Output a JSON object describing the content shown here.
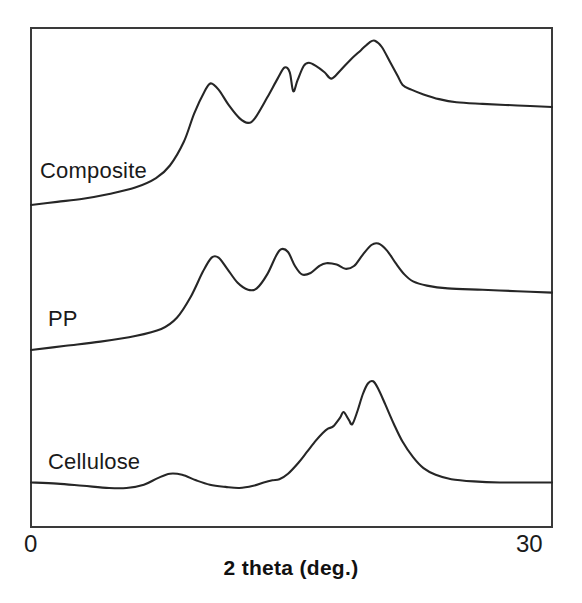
{
  "chart_data": {
    "type": "line",
    "title": "",
    "xlabel": "2 theta (deg.)",
    "ylabel": "",
    "xlim": [
      0,
      30
    ],
    "xticks": [
      0,
      30
    ],
    "xtick_labels": [
      "0",
      "30"
    ],
    "yticks": [],
    "grid": false,
    "legend": "inline-curve-labels",
    "note": "Stacked XRD diffractograms; intensity in arbitrary units, curves offset vertically.",
    "series": [
      {
        "name": "Composite",
        "label": "Composite",
        "color": "#262626",
        "peaks_2theta": [
          10.3,
          14.6,
          16.0,
          19.7,
          21.0
        ],
        "peak_notes": "first peak ~10.3 deg, doublet near 14-16 deg, strongest peak ~19.7 deg with shoulder ~21 deg",
        "points": [
          [
            0.0,
            0.0
          ],
          [
            1.5,
            0.02
          ],
          [
            3.0,
            0.04
          ],
          [
            4.5,
            0.07
          ],
          [
            6.0,
            0.11
          ],
          [
            7.2,
            0.17
          ],
          [
            8.0,
            0.25
          ],
          [
            8.8,
            0.4
          ],
          [
            9.4,
            0.58
          ],
          [
            10.0,
            0.72
          ],
          [
            10.35,
            0.77
          ],
          [
            10.8,
            0.73
          ],
          [
            11.4,
            0.63
          ],
          [
            12.0,
            0.55
          ],
          [
            12.5,
            0.52
          ],
          [
            12.9,
            0.55
          ],
          [
            13.6,
            0.68
          ],
          [
            14.2,
            0.8
          ],
          [
            14.6,
            0.87
          ],
          [
            14.9,
            0.84
          ],
          [
            15.1,
            0.72
          ],
          [
            15.35,
            0.79
          ],
          [
            15.7,
            0.88
          ],
          [
            16.0,
            0.9
          ],
          [
            16.4,
            0.88
          ],
          [
            16.9,
            0.84
          ],
          [
            17.3,
            0.8
          ],
          [
            17.8,
            0.85
          ],
          [
            18.4,
            0.92
          ],
          [
            19.0,
            0.98
          ],
          [
            19.5,
            1.03
          ],
          [
            19.8,
            1.04
          ],
          [
            20.2,
            1.0
          ],
          [
            20.7,
            0.9
          ],
          [
            21.1,
            0.82
          ],
          [
            21.4,
            0.76
          ],
          [
            21.9,
            0.73
          ],
          [
            22.6,
            0.7
          ],
          [
            23.5,
            0.67
          ],
          [
            24.5,
            0.65
          ],
          [
            26.0,
            0.64
          ],
          [
            28.0,
            0.63
          ],
          [
            30.0,
            0.62
          ]
        ]
      },
      {
        "name": "PP",
        "label": "PP",
        "color": "#262626",
        "peaks_2theta": [
          10.5,
          14.3,
          17.0,
          19.5
        ],
        "peak_notes": "polypropylene reflections: ~10.5, ~14.3, ~17.0 deg and main ~19.5 deg",
        "points": [
          [
            0.0,
            0.0
          ],
          [
            2.0,
            0.03
          ],
          [
            4.0,
            0.06
          ],
          [
            6.0,
            0.1
          ],
          [
            7.5,
            0.15
          ],
          [
            8.4,
            0.23
          ],
          [
            9.2,
            0.38
          ],
          [
            9.9,
            0.56
          ],
          [
            10.4,
            0.66
          ],
          [
            10.8,
            0.66
          ],
          [
            11.3,
            0.58
          ],
          [
            11.9,
            0.48
          ],
          [
            12.5,
            0.43
          ],
          [
            13.0,
            0.44
          ],
          [
            13.6,
            0.54
          ],
          [
            14.1,
            0.67
          ],
          [
            14.4,
            0.72
          ],
          [
            14.8,
            0.7
          ],
          [
            15.2,
            0.6
          ],
          [
            15.6,
            0.54
          ],
          [
            16.1,
            0.55
          ],
          [
            16.6,
            0.6
          ],
          [
            17.0,
            0.62
          ],
          [
            17.6,
            0.61
          ],
          [
            18.1,
            0.58
          ],
          [
            18.6,
            0.6
          ],
          [
            19.1,
            0.68
          ],
          [
            19.6,
            0.75
          ],
          [
            20.0,
            0.76
          ],
          [
            20.5,
            0.71
          ],
          [
            21.0,
            0.62
          ],
          [
            21.5,
            0.54
          ],
          [
            22.0,
            0.49
          ],
          [
            22.8,
            0.46
          ],
          [
            24.0,
            0.44
          ],
          [
            26.0,
            0.43
          ],
          [
            28.0,
            0.42
          ],
          [
            30.0,
            0.41
          ]
        ]
      },
      {
        "name": "Cellulose",
        "label": "Cellulose",
        "color": "#262626",
        "peaks_2theta": [
          8.0,
          17.3,
          19.3
        ],
        "peak_notes": "broad low bump ~8 deg, shoulder ~17.3 deg, dominant peak ~19.3 deg",
        "points": [
          [
            0.0,
            0.05
          ],
          [
            1.5,
            0.04
          ],
          [
            3.0,
            0.02
          ],
          [
            4.5,
            0.0
          ],
          [
            5.5,
            0.0
          ],
          [
            6.5,
            0.03
          ],
          [
            7.3,
            0.09
          ],
          [
            8.0,
            0.13
          ],
          [
            8.7,
            0.12
          ],
          [
            9.5,
            0.07
          ],
          [
            10.3,
            0.03
          ],
          [
            11.2,
            0.01
          ],
          [
            12.0,
            0.0
          ],
          [
            12.8,
            0.02
          ],
          [
            13.4,
            0.05
          ],
          [
            13.9,
            0.07
          ],
          [
            14.3,
            0.08
          ],
          [
            14.8,
            0.13
          ],
          [
            15.4,
            0.23
          ],
          [
            15.9,
            0.33
          ],
          [
            16.4,
            0.43
          ],
          [
            16.8,
            0.5
          ],
          [
            17.1,
            0.54
          ],
          [
            17.4,
            0.56
          ],
          [
            17.8,
            0.64
          ],
          [
            18.0,
            0.69
          ],
          [
            18.3,
            0.62
          ],
          [
            18.5,
            0.58
          ],
          [
            18.8,
            0.7
          ],
          [
            19.1,
            0.85
          ],
          [
            19.4,
            0.95
          ],
          [
            19.7,
            0.97
          ],
          [
            20.0,
            0.9
          ],
          [
            20.4,
            0.76
          ],
          [
            20.9,
            0.58
          ],
          [
            21.4,
            0.42
          ],
          [
            22.0,
            0.28
          ],
          [
            22.6,
            0.18
          ],
          [
            23.3,
            0.12
          ],
          [
            24.2,
            0.08
          ],
          [
            25.5,
            0.06
          ],
          [
            27.0,
            0.05
          ],
          [
            28.5,
            0.05
          ],
          [
            30.0,
            0.05
          ]
        ]
      }
    ]
  },
  "axis": {
    "x_title": "2 theta (deg.)",
    "x_min_label": "0",
    "x_max_label": "30"
  },
  "labels": {
    "composite": "Composite",
    "pp": "PP",
    "cellulose": "Cellulose"
  },
  "colors": {
    "curve": "#262626",
    "frame": "#3a3a3a",
    "background": "#ffffff",
    "text": "#1a1a1a"
  }
}
